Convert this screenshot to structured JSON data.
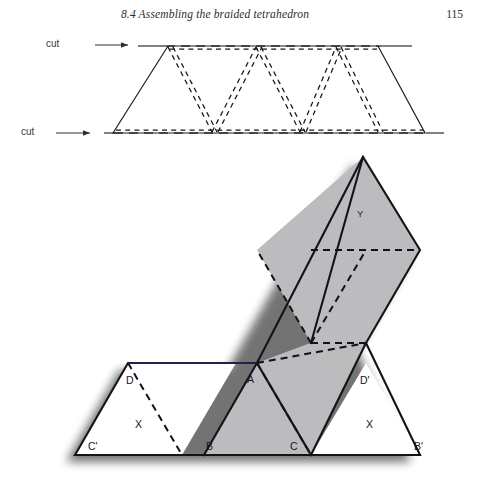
{
  "page": {
    "width": 477,
    "height": 481,
    "background": "#ffffff"
  },
  "header": {
    "title": "8.4  Assembling the braided tetrahedron",
    "page_number": "115"
  },
  "labels": {
    "cut_top": "cut",
    "cut_bottom": "cut"
  },
  "figures": {
    "strip": {
      "name": "braided-strip",
      "description": "Long trapezoidal paper strip of triangles with dashed fold lines between two horizontal cut lines",
      "cut_line_top_y": 46,
      "cut_line_bottom_y": 133,
      "triangle_count": 5
    },
    "net": {
      "name": "tetrahedron-net",
      "description": "Folded net: an L-shaped arrangement of triangles, diagonal arm shaded gray, two white triangles on the baseline",
      "shaded_color": "#bcbcbe",
      "unshaded_color": "#ffffff",
      "vertex_labels": [
        {
          "id": "C-prime",
          "text": "C'",
          "x": 88,
          "y": 447
        },
        {
          "id": "D",
          "text": "D",
          "x": 126,
          "y": 382
        },
        {
          "id": "X-left",
          "text": "X",
          "x": 135,
          "y": 425
        },
        {
          "id": "B",
          "text": "B",
          "x": 206,
          "y": 447
        },
        {
          "id": "A",
          "text": "A",
          "x": 247,
          "y": 380
        },
        {
          "id": "C",
          "text": "C",
          "x": 290,
          "y": 447
        },
        {
          "id": "D-prime",
          "text": "D'",
          "x": 362,
          "y": 381
        },
        {
          "id": "X-right",
          "text": "X",
          "x": 366,
          "y": 425
        },
        {
          "id": "B-prime",
          "text": "B'",
          "x": 418,
          "y": 447
        },
        {
          "id": "Y",
          "text": "Y",
          "x": 360,
          "y": 214
        }
      ]
    }
  }
}
